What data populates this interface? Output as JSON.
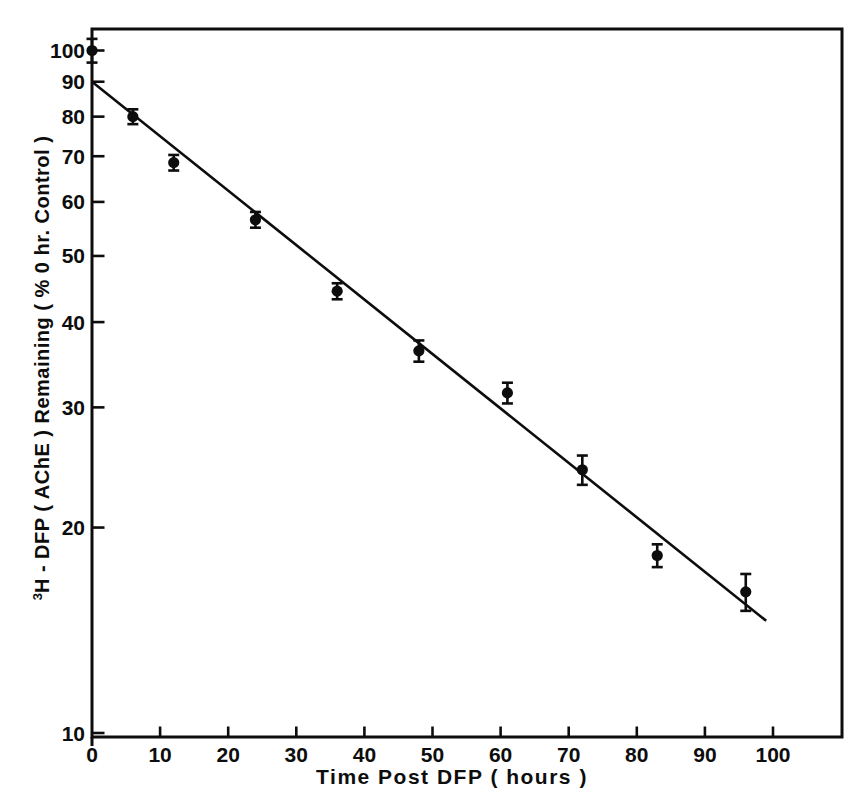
{
  "chart_data": {
    "type": "scatter",
    "title": "",
    "xlabel": "Time Post DFP ( hours )",
    "ylabel": "3H - DFP ( AChE ) Remaining ( % 0 hr. Control )",
    "ylabel_superscript": "3",
    "ylabel_main": "H - DFP ( AChE ) Remaining ( % 0 hr. Control )",
    "y_scale": "log10",
    "grid": "off",
    "legend": "none",
    "xlim": [
      0,
      110
    ],
    "ylim": [
      10,
      107
    ],
    "x_ticks": [
      0,
      10,
      20,
      30,
      40,
      50,
      60,
      70,
      80,
      90,
      100
    ],
    "y_ticks": [
      100,
      90,
      80,
      70,
      60,
      50,
      40,
      30,
      20,
      10
    ],
    "series": [
      {
        "name": "AChE remaining",
        "marker": "filled-circle-with-error-bars",
        "points": [
          {
            "x": 0,
            "y": 100.0,
            "err": 4.0
          },
          {
            "x": 6,
            "y": 80.0,
            "err": 2.0
          },
          {
            "x": 12,
            "y": 68.5,
            "err": 1.8
          },
          {
            "x": 24,
            "y": 56.5,
            "err": 1.5
          },
          {
            "x": 36,
            "y": 44.4,
            "err": 1.2
          },
          {
            "x": 48,
            "y": 36.3,
            "err": 1.3
          },
          {
            "x": 61,
            "y": 31.5,
            "err": 1.1
          },
          {
            "x": 72,
            "y": 24.3,
            "err": 1.2
          },
          {
            "x": 83,
            "y": 18.2,
            "err": 0.7
          },
          {
            "x": 96,
            "y": 16.1,
            "err": 1.0
          }
        ]
      }
    ],
    "fit_line": {
      "x_start": 0,
      "y_start": 90,
      "x_end": 99,
      "y_end": 14.6
    },
    "colors": {
      "ink": "#0d0d0d",
      "background": "#ffffff"
    }
  }
}
